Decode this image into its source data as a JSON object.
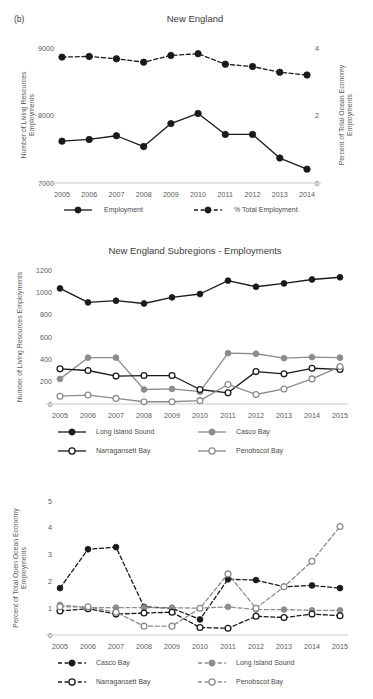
{
  "figure": {
    "panel_label": "(b)"
  },
  "chart_data": [
    {
      "id": "new-england",
      "type": "line",
      "title": "New England",
      "xlabel": "",
      "ylabel": "Number of Living Resources Employments",
      "ylabel_right": "Percent of Total Ocean Economy Employments",
      "categories": [
        "2005",
        "2006",
        "2007",
        "2008",
        "2009",
        "2010",
        "2011",
        "2012",
        "2013",
        "2014"
      ],
      "ylim": [
        7000,
        9000
      ],
      "yticks": [
        7000,
        8000,
        9000
      ],
      "ylim_right": [
        0,
        4
      ],
      "yticks_right": [
        0,
        2,
        4
      ],
      "grid": false,
      "legend_position": "bottom",
      "series": [
        {
          "name": "Employment",
          "axis": "left",
          "style": "solid",
          "marker": "filled",
          "color": "#1a1a1a",
          "values": [
            7620,
            7645,
            7700,
            7540,
            7880,
            8030,
            7720,
            7720,
            7370,
            7205
          ]
        },
        {
          "name": "% Total Employment",
          "axis": "right",
          "style": "dashed",
          "marker": "filled",
          "color": "#1a1a1a",
          "values": [
            3.73,
            3.75,
            3.68,
            3.58,
            3.78,
            3.83,
            3.52,
            3.45,
            3.28,
            3.2
          ]
        }
      ]
    },
    {
      "id": "new-england-subregions-employments",
      "type": "line",
      "title": "New England Subregions - Employments",
      "xlabel": "",
      "ylabel": "Number of Living Resources Employments",
      "categories": [
        "2005",
        "2006",
        "2007",
        "2008",
        "2009",
        "2010",
        "2011",
        "2012",
        "2013",
        "2014",
        "2015"
      ],
      "ylim": [
        0,
        1200
      ],
      "yticks": [
        0,
        200,
        400,
        600,
        800,
        1000,
        1200
      ],
      "grid": false,
      "legend_position": "bottom",
      "series": [
        {
          "name": "Long Island Sound",
          "style": "solid",
          "marker": "filled",
          "color": "#1a1a1a",
          "values": [
            1035,
            910,
            925,
            900,
            955,
            985,
            1105,
            1050,
            1080,
            1115,
            1135
          ]
        },
        {
          "name": "Casco Bay",
          "style": "solid",
          "marker": "filled",
          "color": "#8c8c8c",
          "values": [
            225,
            415,
            415,
            130,
            135,
            110,
            455,
            450,
            410,
            420,
            415
          ]
        },
        {
          "name": "Narragansett Bay",
          "style": "solid",
          "marker": "open",
          "color": "#1a1a1a",
          "values": [
            315,
            300,
            250,
            255,
            255,
            130,
            100,
            290,
            270,
            320,
            310
          ]
        },
        {
          "name": "Penobscot Bay",
          "style": "solid",
          "marker": "open",
          "color": "#8c8c8c",
          "values": [
            70,
            80,
            50,
            20,
            20,
            30,
            175,
            85,
            135,
            225,
            335
          ]
        }
      ]
    },
    {
      "id": "new-england-subregions-percent",
      "type": "line",
      "title": "",
      "xlabel": "",
      "ylabel": "Percent of Total Open Ocean Economy Employments",
      "categories": [
        "2005",
        "2006",
        "2007",
        "2008",
        "2009",
        "2010",
        "2011",
        "2012",
        "2013",
        "2014",
        "2015"
      ],
      "ylim": [
        0,
        5
      ],
      "yticks": [
        0,
        1,
        2,
        3,
        4,
        5
      ],
      "grid": false,
      "legend_position": "bottom",
      "series": [
        {
          "name": "Casco Bay",
          "style": "dashed",
          "marker": "filled",
          "color": "#1a1a1a",
          "values": [
            1.75,
            3.2,
            3.28,
            1.05,
            1.0,
            0.58,
            2.08,
            2.05,
            1.8,
            1.85,
            1.75
          ]
        },
        {
          "name": "Long Island Sound",
          "style": "dashed",
          "marker": "filled",
          "color": "#8c8c8c",
          "values": [
            1.12,
            1.02,
            1.02,
            1.02,
            1.02,
            1.0,
            1.05,
            0.95,
            0.95,
            0.92,
            0.92
          ]
        },
        {
          "name": "Narragansett Bay",
          "style": "dashed",
          "marker": "open",
          "color": "#1a1a1a",
          "values": [
            0.9,
            0.98,
            0.78,
            0.82,
            0.85,
            0.28,
            0.25,
            0.7,
            0.65,
            0.78,
            0.72
          ]
        },
        {
          "name": "Penobscot Bay",
          "style": "dashed",
          "marker": "open",
          "color": "#8c8c8c",
          "values": [
            1.05,
            1.05,
            0.85,
            0.33,
            0.33,
            1.0,
            2.28,
            1.0,
            1.8,
            2.75,
            4.05
          ]
        }
      ]
    }
  ]
}
